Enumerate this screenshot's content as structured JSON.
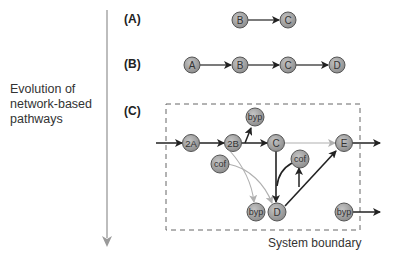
{
  "side_label": {
    "lines": [
      "Evolution of",
      "network-based",
      "pathways"
    ]
  },
  "panels": {
    "a": {
      "label": "(A)",
      "nodes": [
        "B",
        "C"
      ]
    },
    "b": {
      "label": "(B)",
      "nodes": [
        "A",
        "B",
        "C",
        "D"
      ]
    },
    "c": {
      "label": "(C)",
      "nodes": {
        "n2a": "2A",
        "n2b": "2B",
        "byp_top": "byp",
        "c": "C",
        "e": "E",
        "cof_left": "cof",
        "cof_right": "cof",
        "byp_bottom": "byp",
        "d": "D",
        "byp_right": "byp"
      },
      "boundary_label": "System boundary"
    }
  },
  "colors": {
    "node_fill": "#9e9e9e",
    "node_stroke": "#555555",
    "arrow_dark": "#222222",
    "arrow_light": "#b0b0b0",
    "axis": "#9a9a9a",
    "boundary": "#666666"
  }
}
